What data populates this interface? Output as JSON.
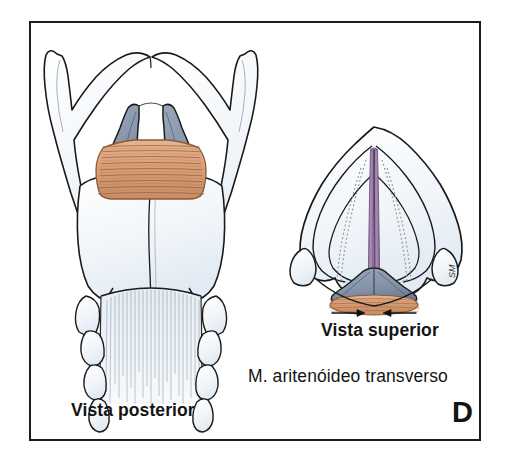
{
  "figure": {
    "panel_letter": "D",
    "labels": {
      "posterior_view": "Vista posterior",
      "superior_view": "Vista superior",
      "muscle_caption": "M. aritenóideo transverso"
    },
    "artist_signature": "SM",
    "colors": {
      "frame": "#1d1d1d",
      "ink": "#1a1a1a",
      "cartilage_pale": "#eef3f8",
      "arytenoid_blue": "#8795ab",
      "arytenoid_blue_dark": "#6d7b92",
      "muscle_orange": "#d9a078",
      "muscle_orange_light": "#e7bd9a",
      "muscle_striation": "#9a5f3b",
      "vocal_fold_purple": "#9b7fa8",
      "vocal_fold_purple_dark": "#7d5f8c",
      "dotted_gray": "#8e8e94",
      "text": "#141414"
    },
    "views": [
      {
        "name": "posterior",
        "label": "Vista posterior",
        "structures": [
          "thyroid cartilage superior horns",
          "thyroid cartilage laminae",
          "thyroid cartilage inferior horns",
          "arytenoid cartilages",
          "transverse arytenoid muscle",
          "cricoid lamina",
          "trachea"
        ]
      },
      {
        "name": "superior",
        "label": "Vista superior",
        "structures": [
          "epiglottis",
          "vestibular folds",
          "vocal folds",
          "rima glottidis",
          "arytenoid cartilages",
          "transverse arytenoid muscle",
          "adduction arrows"
        ]
      }
    ]
  }
}
